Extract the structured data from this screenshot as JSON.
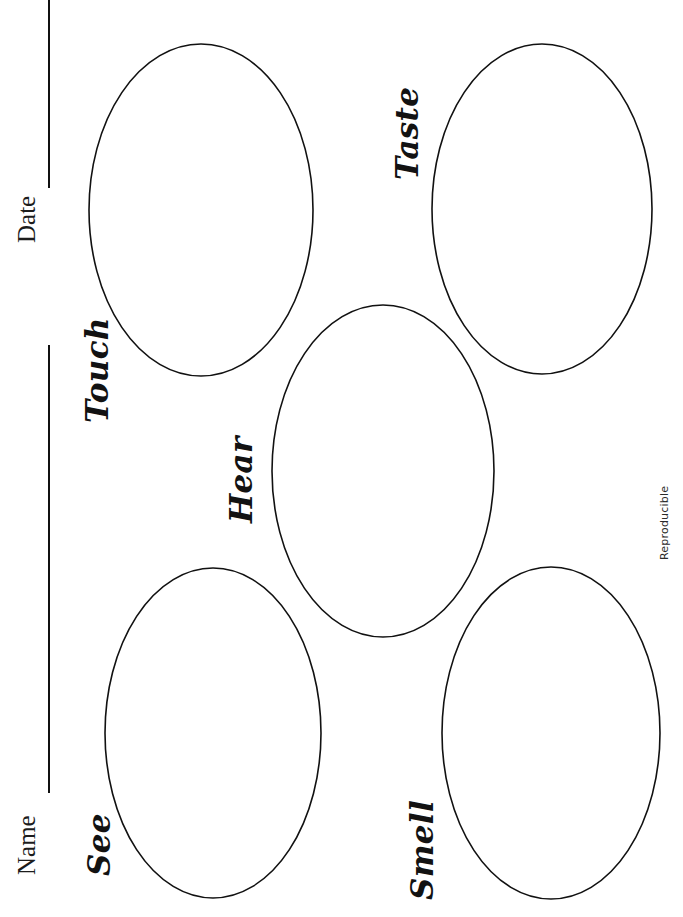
{
  "page": {
    "orientation": "rotated-landscape",
    "width": 683,
    "height": 917,
    "background_color": "#ffffff",
    "ink_color": "#111111"
  },
  "form_fields": [
    {
      "id": "name",
      "label": "Name",
      "placeholder": "",
      "value": "",
      "rule_color": "#111111"
    },
    {
      "id": "date",
      "label": "Date",
      "placeholder": "",
      "value": "",
      "rule_color": "#111111"
    }
  ],
  "senses": [
    {
      "id": "touch",
      "label": "Touch",
      "value": "",
      "ellipse": {
        "cx": 201,
        "cy": 210,
        "rx": 112,
        "ry": 166
      }
    },
    {
      "id": "taste",
      "label": "Taste",
      "value": "",
      "ellipse": {
        "cx": 542,
        "cy": 209,
        "rx": 110,
        "ry": 165
      }
    },
    {
      "id": "hear",
      "label": "Hear",
      "value": "",
      "ellipse": {
        "cx": 383,
        "cy": 471,
        "rx": 111,
        "ry": 166
      }
    },
    {
      "id": "see",
      "label": "See",
      "value": "",
      "ellipse": {
        "cx": 213,
        "cy": 733,
        "rx": 108,
        "ry": 165
      }
    },
    {
      "id": "smell",
      "label": "Smell",
      "value": "",
      "ellipse": {
        "cx": 551,
        "cy": 733,
        "rx": 109,
        "ry": 166
      }
    }
  ],
  "footer": {
    "reproducible_note": "Reproducible"
  }
}
